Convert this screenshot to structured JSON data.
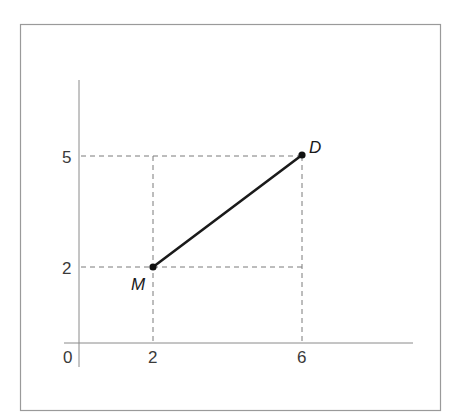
{
  "diagram": {
    "type": "coordinate-plane-segment",
    "frame": {
      "x": 20,
      "y": 24,
      "width": 421,
      "height": 387,
      "stroke": "#9a9a9a"
    },
    "axes": {
      "origin_label": "0",
      "x_axis": {
        "x1": 64,
        "x2": 413,
        "y": 343
      },
      "y_axis": {
        "x": 79,
        "y1": 80,
        "y2": 367
      },
      "x_ticks": [
        {
          "value": 2,
          "label": "2",
          "px": 153
        },
        {
          "value": 6,
          "label": "6",
          "px": 302
        }
      ],
      "y_ticks": [
        {
          "value": 5,
          "label": "5",
          "py": 156
        },
        {
          "value": 2,
          "label": "2",
          "py": 267
        }
      ],
      "color": "#8a8a8a"
    },
    "points": [
      {
        "name": "M",
        "label": "M",
        "x": 2,
        "y": 2,
        "px": 153,
        "py": 267
      },
      {
        "name": "D",
        "label": "D",
        "x": 6,
        "y": 5,
        "px": 302,
        "py": 155
      }
    ],
    "segment": {
      "from": "M",
      "to": "D",
      "color": "#1a1a1a"
    },
    "guides": {
      "style": "dashed",
      "color": "#7a7a7a"
    }
  }
}
